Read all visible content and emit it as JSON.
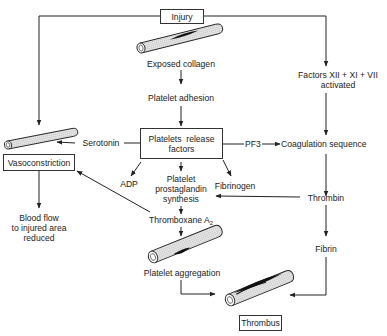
{
  "diagram": {
    "title_node": "Injury",
    "nodes": {
      "injury": "Injury",
      "exposed_collagen": "Exposed collagen",
      "platelet_adhesion": "Platelet adhesion",
      "platelets_release_factors_line1": "Platelets  release",
      "platelets_release_factors_line2": "factors",
      "factors_activated_line1": "Factors XII + XI + VII",
      "factors_activated_line2": "activated",
      "serotonin": "Serotonin",
      "pf3": "PF3",
      "coagulation_sequence": "Coagulation sequence",
      "vasoconstriction": "Vasoconstriction",
      "adp": "ADP",
      "platelet_prostaglandin_line1": "Platelet",
      "platelet_prostaglandin_line2": "prostaglandin",
      "platelet_prostaglandin_line3": "synthesis",
      "fibrinogen": "Fibrinogen",
      "thrombin": "Thrombin",
      "blood_flow_line1": "Blood flow",
      "blood_flow_line2": "to injured area",
      "blood_flow_line3": "reduced",
      "thromboxane": "Thromboxane A",
      "thromboxane_sub": "2",
      "fibrin": "Fibrin",
      "platelet_aggregation": "Platelet aggregation",
      "thrombus": "Thrombus"
    },
    "edges": [
      {
        "from": "Injury",
        "to": "Exposed collagen"
      },
      {
        "from": "Injury",
        "to": "Vasoconstriction (vessel)"
      },
      {
        "from": "Injury",
        "to": "Factors XII + XI + VII activated"
      },
      {
        "from": "Exposed collagen",
        "to": "Platelet adhesion"
      },
      {
        "from": "Platelet adhesion",
        "to": "Platelets release factors"
      },
      {
        "from": "Platelets release factors",
        "to": "Serotonin"
      },
      {
        "from": "Serotonin",
        "to": "Vasoconstriction (vessel)"
      },
      {
        "from": "Platelets release factors",
        "to": "PF3"
      },
      {
        "from": "PF3",
        "to": "Coagulation sequence"
      },
      {
        "from": "Factors XII + XI + VII activated",
        "to": "Coagulation sequence"
      },
      {
        "from": "Platelets release factors",
        "to": "ADP"
      },
      {
        "from": "Platelets release factors",
        "to": "Platelet prostaglandin synthesis"
      },
      {
        "from": "Platelets release factors",
        "to": "Fibrinogen"
      },
      {
        "from": "Coagulation sequence",
        "to": "Thrombin"
      },
      {
        "from": "Thrombin",
        "to": "Platelet prostaglandin synthesis"
      },
      {
        "from": "Thrombin",
        "to": "Fibrin"
      },
      {
        "from": "Platelet prostaglandin synthesis",
        "to": "Thromboxane A2"
      },
      {
        "from": "Thromboxane A2",
        "to": "Vasoconstriction"
      },
      {
        "from": "Thromboxane A2",
        "to": "Platelet aggregation"
      },
      {
        "from": "Vasoconstriction",
        "to": "Blood flow to injured area reduced"
      },
      {
        "from": "Platelet aggregation",
        "to": "Thrombus"
      },
      {
        "from": "Fibrin",
        "to": "Thrombus"
      }
    ],
    "vessel_icons": [
      "injured-vessel-icon",
      "constricted-vessel-icon",
      "aggregation-vessel-icon",
      "thrombus-vessel-icon"
    ],
    "colors": {
      "line": "#222222",
      "vessel_fill": "#d9d9d9",
      "clot": "#1a1a1a",
      "background": "#ffffff"
    }
  }
}
